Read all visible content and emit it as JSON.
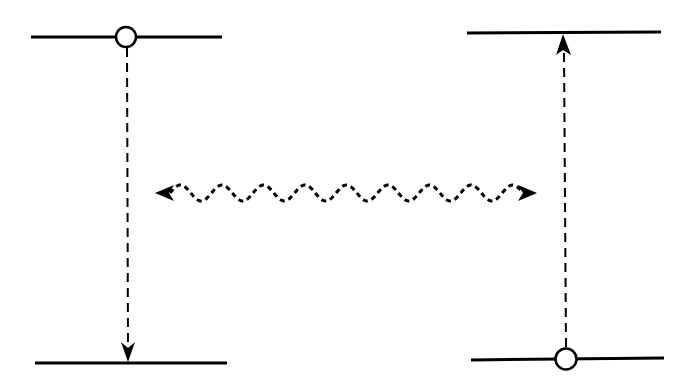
{
  "diagram": {
    "type": "energy-level-transfer",
    "colors": {
      "line": "#000000",
      "background": "#ffffff",
      "hole_fill": "#ffffff"
    },
    "left_system": {
      "upper_level": {
        "x1": 31,
        "x2": 222,
        "y": 37
      },
      "lower_level": {
        "x1": 35,
        "x2": 227,
        "y": 363
      },
      "hole": {
        "cx": 126,
        "cy": 37,
        "r": 10
      },
      "transition": {
        "x": 127,
        "y_start": 48,
        "y_end": 362,
        "direction": "down",
        "style": "dashed"
      }
    },
    "right_system": {
      "upper_level": {
        "x1": 467,
        "x2": 661,
        "y": 33
      },
      "lower_level": {
        "x1": 471,
        "x2": 664,
        "y": 359
      },
      "hole": {
        "cx": 566,
        "cy": 359,
        "r": 10
      },
      "transition": {
        "x": 564,
        "y_start": 348,
        "y_end": 34,
        "direction": "up",
        "style": "dashed"
      }
    },
    "coupling": {
      "type": "wavy-double-arrow",
      "x_start": 156,
      "x_end": 537,
      "y": 193,
      "amplitude": 8,
      "periods": 8.5,
      "style": "dashed"
    }
  }
}
